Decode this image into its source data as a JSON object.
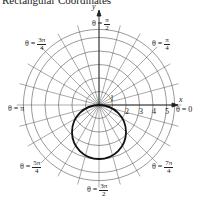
{
  "title": "Rectangular Coordinates",
  "axes": {
    "x_label": "x",
    "y_label": "y"
  },
  "radial_ticks": [
    "1",
    "2",
    "3",
    "4",
    "5"
  ],
  "angle_labels": {
    "theta_0": {
      "prefix": "θ = ",
      "value": "0"
    },
    "theta_pi_4": {
      "prefix": "θ = ",
      "num": "π",
      "den": "4"
    },
    "theta_pi_2": {
      "prefix": "θ = ",
      "num": "π",
      "den": "2"
    },
    "theta_3pi_4": {
      "prefix": "θ = ",
      "num": "3π",
      "den": "4"
    },
    "theta_pi": {
      "prefix": "θ = ",
      "value": "π"
    },
    "theta_5pi_4": {
      "prefix": "θ = ",
      "num": "5π",
      "den": "4"
    },
    "theta_3pi_2": {
      "prefix": "θ = ",
      "num": "3π",
      "den": "2"
    },
    "theta_7pi_4": {
      "prefix": "θ = ",
      "num": "7π",
      "den": "4"
    }
  },
  "curve": {
    "description": "circle through pole, below x-axis",
    "equation": "r = -4 sin θ",
    "color": "#111111"
  },
  "grid_color": "#555555"
}
